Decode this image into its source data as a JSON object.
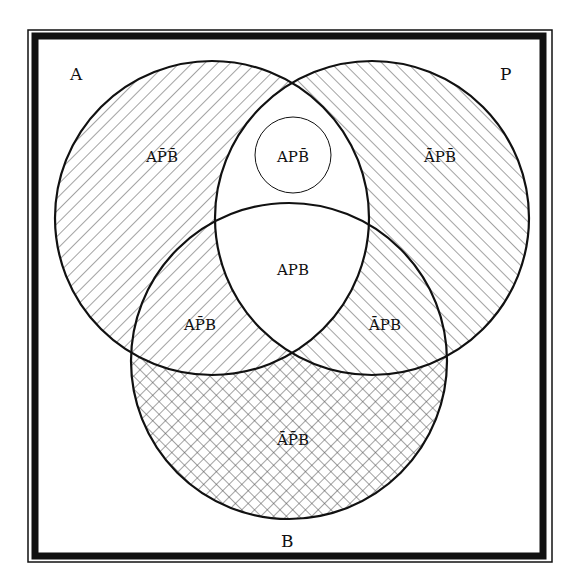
{
  "diagram": {
    "colors": {
      "line": "#111111",
      "hatch": "#555555",
      "background": "#ffffff",
      "frame": "#111111"
    },
    "frame": {
      "outer": {
        "x": 28,
        "y": 30,
        "w": 524,
        "h": 532
      },
      "inner": {
        "x": 35,
        "y": 36,
        "w": 508,
        "h": 520,
        "stroke_width": 7
      }
    },
    "sets": [
      {
        "id": "A",
        "label": "A",
        "cx": 212,
        "cy": 218,
        "r": 157,
        "label_x": 70,
        "label_y": 80,
        "hatch": "forward-diagonal"
      },
      {
        "id": "P",
        "label": "P",
        "cx": 372,
        "cy": 218,
        "r": 157,
        "label_x": 500,
        "label_y": 80,
        "hatch": "backward-diagonal"
      },
      {
        "id": "B",
        "label": "B",
        "cx": 289,
        "cy": 361,
        "r": 158,
        "label_x": 281,
        "label_y": 547,
        "hatch": "crosshatch"
      }
    ],
    "inner_circle": {
      "cx": 293,
      "cy": 155,
      "r": 38,
      "label": "APB̄"
    },
    "regions": [
      {
        "id": "A-notP-notB",
        "label": "AP̄B̄",
        "x": 162,
        "y": 162,
        "fill": "forward-diagonal"
      },
      {
        "id": "A-P-notB",
        "label": "APB̄",
        "x": 293,
        "y": 162,
        "fill": "white"
      },
      {
        "id": "notA-P-notB",
        "label": "ĀPB̄",
        "x": 440,
        "y": 162,
        "fill": "backward-diagonal"
      },
      {
        "id": "A-P-B",
        "label": "APB",
        "x": 293,
        "y": 275,
        "fill": "white"
      },
      {
        "id": "A-notP-B",
        "label": "AP̄B",
        "x": 200,
        "y": 330,
        "fill": "forward-diagonal"
      },
      {
        "id": "notA-P-B",
        "label": "ĀPB",
        "x": 385,
        "y": 330,
        "fill": "backward-diagonal"
      },
      {
        "id": "notA-notP-B",
        "label": "ĀP̄B",
        "x": 293,
        "y": 445,
        "fill": "crosshatch"
      }
    ]
  }
}
